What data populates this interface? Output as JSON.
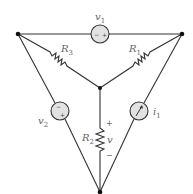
{
  "diagram": {
    "type": "circuit",
    "colors": {
      "wire": "#333333",
      "source_fill": "#e2e2e2",
      "label": "#666666",
      "node": "#111111"
    },
    "nodes": [
      {
        "id": "top-left",
        "x": 18,
        "y": 34
      },
      {
        "id": "top-right",
        "x": 182,
        "y": 34
      },
      {
        "id": "center",
        "x": 100,
        "y": 88
      },
      {
        "id": "bottom",
        "x": 100,
        "y": 192
      }
    ],
    "components": {
      "v1": {
        "label": "v",
        "sub": "1",
        "kind": "voltage-source",
        "minus": "−",
        "plus": "+"
      },
      "v2": {
        "label": "v",
        "sub": "2",
        "kind": "voltage-source",
        "minus": "−",
        "plus": "+"
      },
      "i1": {
        "label": "i",
        "sub": "1",
        "kind": "current-source"
      },
      "R1": {
        "label": "R",
        "sub": "1",
        "kind": "resistor"
      },
      "R2": {
        "label": "R",
        "sub": "2",
        "kind": "resistor"
      },
      "R3": {
        "label": "R",
        "sub": "3",
        "kind": "resistor"
      },
      "v": {
        "label": "v",
        "plus": "+",
        "minus": "−"
      }
    }
  }
}
